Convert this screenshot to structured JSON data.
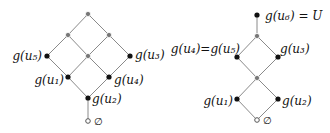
{
  "diagrams": [
    {
      "id": "left-lattice",
      "nodes": [
        {
          "id": "top",
          "x": 88,
          "y": 14,
          "style": "gray",
          "label": ""
        },
        {
          "id": "r2l",
          "x": 68,
          "y": 35,
          "style": "gray",
          "label": ""
        },
        {
          "id": "r2r",
          "x": 109,
          "y": 35,
          "style": "gray",
          "label": ""
        },
        {
          "id": "u5",
          "x": 47,
          "y": 56,
          "style": "black",
          "label": "g(u5)"
        },
        {
          "id": "mid",
          "x": 88,
          "y": 56,
          "style": "gray",
          "label": ""
        },
        {
          "id": "u3",
          "x": 130,
          "y": 56,
          "style": "black",
          "label": "g(u3)"
        },
        {
          "id": "u1",
          "x": 68,
          "y": 77,
          "style": "black",
          "label": "g(u1)"
        },
        {
          "id": "u4",
          "x": 109,
          "y": 77,
          "style": "black",
          "label": "g(u4)"
        },
        {
          "id": "u2",
          "x": 88,
          "y": 98,
          "style": "black",
          "label": "g(u2)"
        },
        {
          "id": "empty",
          "x": 88,
          "y": 121,
          "style": "hollow",
          "label": "∅"
        }
      ],
      "edges": [
        [
          "top",
          "r2l"
        ],
        [
          "top",
          "r2r"
        ],
        [
          "r2l",
          "u5"
        ],
        [
          "r2l",
          "mid"
        ],
        [
          "r2r",
          "mid"
        ],
        [
          "r2r",
          "u3"
        ],
        [
          "u5",
          "u1"
        ],
        [
          "mid",
          "u1"
        ],
        [
          "mid",
          "u4"
        ],
        [
          "u3",
          "u4"
        ],
        [
          "u1",
          "u2"
        ],
        [
          "u4",
          "u2"
        ],
        [
          "u2",
          "empty"
        ]
      ]
    },
    {
      "id": "right-lattice",
      "nodes": [
        {
          "id": "u6",
          "x": 257,
          "y": 15,
          "style": "black",
          "label": "g(u6) = U"
        },
        {
          "id": "t",
          "x": 257,
          "y": 36,
          "style": "gray",
          "label": ""
        },
        {
          "id": "u45",
          "x": 237,
          "y": 57,
          "style": "black",
          "label": "g(u4)=g(u5)"
        },
        {
          "id": "u3",
          "x": 278,
          "y": 57,
          "style": "black",
          "label": "g(u3)"
        },
        {
          "id": "m",
          "x": 257,
          "y": 78,
          "style": "gray",
          "label": ""
        },
        {
          "id": "u1",
          "x": 237,
          "y": 99,
          "style": "black",
          "label": "g(u1)"
        },
        {
          "id": "u2",
          "x": 278,
          "y": 99,
          "style": "black",
          "label": "g(u2)"
        },
        {
          "id": "empty",
          "x": 257,
          "y": 120,
          "style": "hollow",
          "label": "∅"
        }
      ],
      "edges": [
        [
          "u6",
          "t"
        ],
        [
          "t",
          "u45"
        ],
        [
          "t",
          "u3"
        ],
        [
          "u45",
          "m"
        ],
        [
          "u3",
          "m"
        ],
        [
          "m",
          "u1"
        ],
        [
          "m",
          "u2"
        ],
        [
          "u1",
          "empty"
        ],
        [
          "u2",
          "empty"
        ]
      ]
    }
  ],
  "labels": {
    "left_u5": "g(u₅)",
    "left_u3": "g(u₃)",
    "left_u1": "g(u₁)",
    "left_u4": "g(u₄)",
    "left_u2": "g(u₂)",
    "left_empty": "∅",
    "right_u6": "g(u₆) = U",
    "right_u45": "g(u₄)=g(u₅)",
    "right_u3": "g(u₃)",
    "right_u1": "g(u₁)",
    "right_u2": "g(u₂)",
    "right_empty": "∅"
  }
}
